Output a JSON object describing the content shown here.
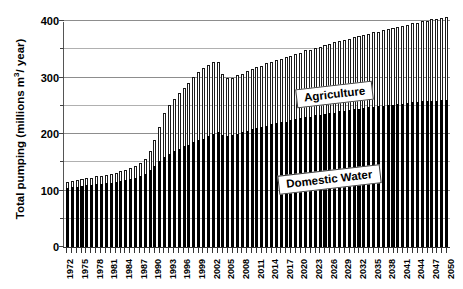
{
  "chart_data": {
    "type": "bar",
    "stacked": true,
    "title": "",
    "xlabel": "",
    "ylabel": "Total pumping (millions m3/ year)",
    "ylabel_parts": {
      "pre": "Total pumping (millions m",
      "sup": "3",
      "post": "/ year)"
    },
    "ylim": [
      0,
      400
    ],
    "yticks_major": [
      0,
      100,
      200,
      300,
      400
    ],
    "yticks_minor": [
      50,
      150,
      250,
      350
    ],
    "ytick_labels": [
      "0",
      "100",
      "200",
      "300",
      "400"
    ],
    "grid": true,
    "legend_position": "inline-callouts",
    "series": [
      {
        "name": "Domestic Water",
        "color": "#000000",
        "values": [
          105,
          106,
          107,
          108,
          109,
          110,
          111,
          112,
          113,
          114,
          115,
          117,
          119,
          121,
          123,
          126,
          130,
          136,
          143,
          152,
          160,
          165,
          170,
          174,
          178,
          181,
          185,
          189,
          192,
          196,
          200,
          203,
          199,
          196,
          198,
          200,
          203,
          206,
          209,
          211,
          213,
          215,
          217,
          219,
          221,
          222,
          224,
          226,
          228,
          230,
          231,
          233,
          234,
          236,
          237,
          238,
          240,
          241,
          242,
          244,
          245,
          246,
          247,
          248,
          249,
          250,
          251,
          252,
          253,
          254,
          255,
          256,
          257,
          258,
          258,
          259,
          259,
          260,
          260
        ]
      },
      {
        "name": "Agriculture",
        "color": "#ffffff",
        "values": [
          10,
          11,
          12,
          12,
          13,
          13,
          14,
          14,
          15,
          15,
          16,
          17,
          18,
          19,
          20,
          22,
          26,
          34,
          46,
          60,
          78,
          86,
          92,
          98,
          104,
          110,
          116,
          120,
          124,
          126,
          128,
          124,
          108,
          104,
          102,
          104,
          104,
          106,
          106,
          108,
          108,
          110,
          110,
          112,
          112,
          114,
          114,
          116,
          116,
          118,
          118,
          120,
          120,
          122,
          122,
          124,
          124,
          126,
          126,
          128,
          128,
          130,
          130,
          132,
          132,
          134,
          134,
          136,
          136,
          138,
          138,
          140,
          140,
          142,
          142,
          144,
          144,
          146,
          148
        ]
      }
    ],
    "categories": [
      "1972",
      "1973",
      "1974",
      "1975",
      "1976",
      "1977",
      "1978",
      "1979",
      "1980",
      "1981",
      "1982",
      "1983",
      "1984",
      "1985",
      "1986",
      "1987",
      "1988",
      "1989",
      "1990",
      "1991",
      "1992",
      "1993",
      "1994",
      "1995",
      "1996",
      "1997",
      "1998",
      "1999",
      "2000",
      "2001",
      "2002",
      "2003",
      "2004",
      "2005",
      "2006",
      "2007",
      "2008",
      "2009",
      "2010",
      "2011",
      "2012",
      "2013",
      "2014",
      "2015",
      "2016",
      "2017",
      "2018",
      "2019",
      "2020",
      "2021",
      "2022",
      "2023",
      "2024",
      "2025",
      "2026",
      "2027",
      "2028",
      "2029",
      "2030",
      "2031",
      "2032",
      "2033",
      "2034",
      "2035",
      "2036",
      "2037",
      "2038",
      "2039",
      "2040",
      "2041",
      "2042",
      "2043",
      "2044",
      "2045",
      "2046",
      "2047",
      "2048",
      "2049",
      "2050"
    ],
    "xtick_labels_shown": [
      "1972",
      "1975",
      "1978",
      "1981",
      "1984",
      "1987",
      "1990",
      "1993",
      "1996",
      "1999",
      "2002",
      "2005",
      "2008",
      "2011",
      "2014",
      "2017",
      "2020",
      "2023",
      "2026",
      "2029",
      "2032",
      "2035",
      "2038",
      "2041",
      "2044",
      "2047",
      "2050"
    ],
    "annotations": [
      {
        "name": "agriculture-callout",
        "text": "Agriculture"
      },
      {
        "name": "domestic-water-callout",
        "text": "Domestic Water"
      }
    ]
  }
}
